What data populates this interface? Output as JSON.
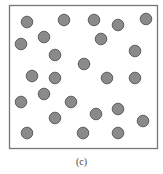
{
  "figure": {
    "label": "(c)",
    "box": {
      "x": 9.5,
      "y": 5.5,
      "width": 148,
      "height": 143,
      "stroke": "#777777",
      "stroke_width": 1.3
    },
    "particle_style": {
      "radius": 5.8,
      "fill": "#8a8a8a",
      "stroke": "#555555",
      "stroke_width": 0.9
    },
    "particle_count": 25,
    "particles": [
      {
        "x": 27,
        "y": 22
      },
      {
        "x": 64,
        "y": 20
      },
      {
        "x": 94,
        "y": 20
      },
      {
        "x": 118,
        "y": 25
      },
      {
        "x": 146,
        "y": 19
      },
      {
        "x": 21,
        "y": 44
      },
      {
        "x": 44,
        "y": 37
      },
      {
        "x": 101,
        "y": 39
      },
      {
        "x": 55,
        "y": 55
      },
      {
        "x": 135,
        "y": 51
      },
      {
        "x": 84,
        "y": 64
      },
      {
        "x": 32,
        "y": 76
      },
      {
        "x": 55,
        "y": 78
      },
      {
        "x": 107,
        "y": 78
      },
      {
        "x": 135,
        "y": 78
      },
      {
        "x": 44,
        "y": 94
      },
      {
        "x": 21,
        "y": 102
      },
      {
        "x": 71,
        "y": 102
      },
      {
        "x": 118,
        "y": 109
      },
      {
        "x": 96,
        "y": 114
      },
      {
        "x": 55,
        "y": 118
      },
      {
        "x": 143,
        "y": 121
      },
      {
        "x": 27,
        "y": 133
      },
      {
        "x": 83,
        "y": 133
      },
      {
        "x": 118,
        "y": 133
      }
    ]
  }
}
